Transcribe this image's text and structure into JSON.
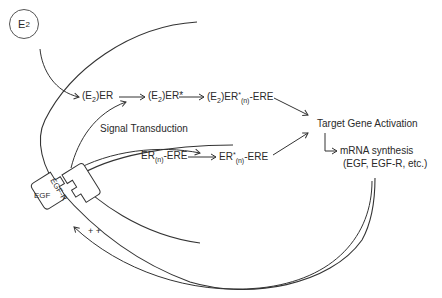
{
  "diagram": {
    "type": "estrogen / EGF signaling pathway",
    "ligand": {
      "main": "E",
      "sub": "2"
    },
    "pathway_top": [
      {
        "id": "e2er",
        "pre": "(E",
        "sub": "2",
        "post": ")ER"
      },
      {
        "id": "e2er_star",
        "pre": "(E",
        "sub": "2",
        "post": ")ER*"
      },
      {
        "id": "e2er_star_n_ere",
        "pre": "(E",
        "sub": "2",
        "post": ")ER",
        "sup": "*",
        "sub2": "(n)",
        "tail": "-ERE"
      }
    ],
    "pathway_bottom": [
      {
        "id": "er_n_ere",
        "pre": "ER",
        "sub": "(n)",
        "tail": "-ERE"
      },
      {
        "id": "er_star_n_ere",
        "pre": "ER",
        "sup": "*",
        "sub": "(n)",
        "tail": "-ERE"
      }
    ],
    "signal_transduction": "Signal Transduction",
    "target_gene_activation": "Target Gene Activation",
    "mrna_synthesis": "mRNA synthesis",
    "mrna_products": "(EGF, EGF-R, etc.)",
    "receptor_label": "EGF-R",
    "growth_factor_label": "EGF",
    "feedback_label": "+ +",
    "line_color": "#333333"
  }
}
